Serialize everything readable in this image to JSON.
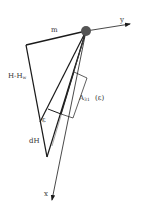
{
  "figure": {
    "type": "geometric-diagram",
    "labels": {
      "y_axis": "y",
      "x_axis": "x",
      "top_segment": "m",
      "left_segment_main": "H-H",
      "left_segment_sub": "w",
      "area_main": "A",
      "area_sub": "31",
      "area_arg": "(ε)",
      "angle": "ε",
      "differential": "dH"
    },
    "colors": {
      "line": "#1a1a1a",
      "thin_line": "#555555",
      "dot": "#555555",
      "text": "#333333",
      "background": "#ffffff"
    }
  }
}
